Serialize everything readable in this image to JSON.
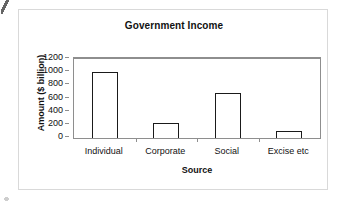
{
  "chart_data": {
    "type": "bar",
    "title": "Government Income",
    "xlabel": "Source",
    "ylabel": "Amount ($ billion)",
    "categories": [
      "Individual",
      "Corporate",
      "Social",
      "Excise etc"
    ],
    "values": [
      1000,
      230,
      680,
      100
    ],
    "ylim": [
      0,
      1200
    ],
    "ytick_values": [
      0,
      200,
      400,
      600,
      800,
      1000,
      1200
    ],
    "ytick_labels": [
      "0",
      "200",
      "400",
      "600",
      "800",
      "1000",
      "1200"
    ],
    "grid": false,
    "legend": false,
    "legend_position": "none",
    "bar_fill": "#ffffff",
    "bar_edge": "#1a1a1a",
    "axis_color": "#8e8e8e",
    "text_color": "#111111",
    "background": "#ffffff"
  },
  "figure": {
    "frame_color": "#d9d9d9"
  }
}
